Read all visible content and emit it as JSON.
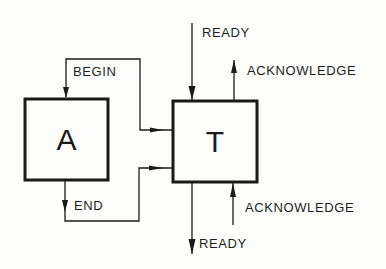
{
  "diagram": {
    "colors": {
      "ink": "#1a1a1a",
      "paper": "#fdfdfb"
    },
    "blocks": [
      {
        "id": "A",
        "label": "A"
      },
      {
        "id": "T",
        "label": "T"
      }
    ],
    "signals": {
      "begin": "BEGIN",
      "end": "END",
      "ready_in": "READY",
      "acknowledge_out": "ACKNOWLEDGE",
      "acknowledge_in": "ACKNOWLEDGE",
      "ready_out": "READY"
    },
    "connections": [
      {
        "from": "T",
        "to": "A",
        "label": "BEGIN"
      },
      {
        "from": "A",
        "to": "T",
        "label": "END"
      },
      {
        "from": "external",
        "to": "T",
        "label": "READY"
      },
      {
        "from": "T",
        "to": "external",
        "label": "ACKNOWLEDGE"
      },
      {
        "from": "external",
        "to": "T",
        "label": "ACKNOWLEDGE"
      },
      {
        "from": "T",
        "to": "external",
        "label": "READY"
      }
    ]
  }
}
